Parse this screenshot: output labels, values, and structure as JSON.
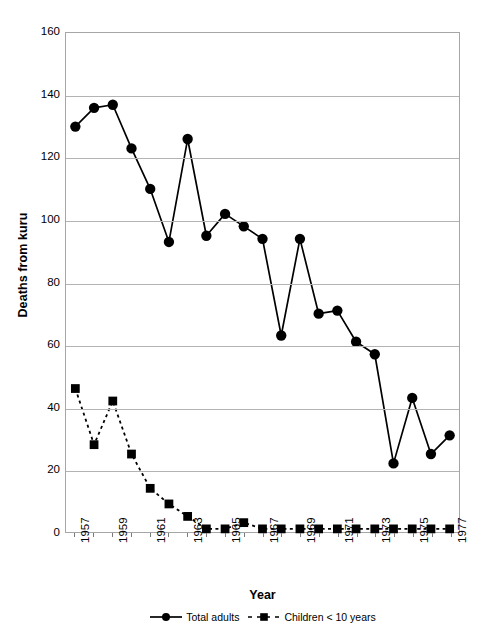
{
  "chart_data": {
    "type": "line",
    "title": "",
    "xlabel": "Year",
    "ylabel": "Deaths from kuru",
    "xlim": [
      1956.5,
      1977.5
    ],
    "ylim": [
      0,
      160
    ],
    "ytick_step": 20,
    "yticks": [
      0,
      20,
      40,
      60,
      80,
      100,
      120,
      140,
      160
    ],
    "xticks": [
      1957,
      1958,
      1959,
      1960,
      1961,
      1962,
      1963,
      1964,
      1965,
      1966,
      1967,
      1968,
      1969,
      1970,
      1971,
      1972,
      1973,
      1974,
      1975,
      1976,
      1977
    ],
    "xtick_labels": [
      "1957",
      "",
      "1959",
      "",
      "1961",
      "",
      "1963",
      "",
      "1965",
      "",
      "1967",
      "",
      "1969",
      "",
      "1971",
      "",
      "1973",
      "",
      "1975",
      "",
      "1977"
    ],
    "grid": "horizontal",
    "legend_position": "bottom",
    "x": [
      1957,
      1958,
      1959,
      1960,
      1961,
      1962,
      1963,
      1964,
      1965,
      1966,
      1967,
      1968,
      1969,
      1970,
      1971,
      1972,
      1973,
      1974,
      1975,
      1976,
      1977
    ],
    "series": [
      {
        "name": "Total adults",
        "marker": "circle",
        "linestyle": "solid",
        "color": "#000000",
        "values": [
          130,
          136,
          137,
          123,
          110,
          93,
          126,
          95,
          102,
          98,
          94,
          63,
          94,
          70,
          71,
          61,
          57,
          22,
          43,
          25,
          31
        ]
      },
      {
        "name": "Children < 10 years",
        "marker": "square",
        "linestyle": "dashed",
        "color": "#000000",
        "values": [
          46,
          28,
          42,
          25,
          14,
          9,
          5,
          1,
          1,
          3,
          1,
          1,
          1,
          1,
          1,
          1,
          1,
          1,
          1,
          1,
          1
        ]
      }
    ]
  },
  "axes": {
    "y_title": "Deaths from kuru",
    "x_title": "Year"
  },
  "legend": {
    "entries": [
      {
        "label": "Total adults",
        "marker": "circle",
        "linestyle": "solid"
      },
      {
        "label": "Children < 10 years",
        "marker": "square",
        "linestyle": "dashed"
      }
    ]
  },
  "colors": {
    "series": "#000000",
    "gridline": "#b3b3b3",
    "axis": "#a6a6a6",
    "background": "#ffffff"
  }
}
